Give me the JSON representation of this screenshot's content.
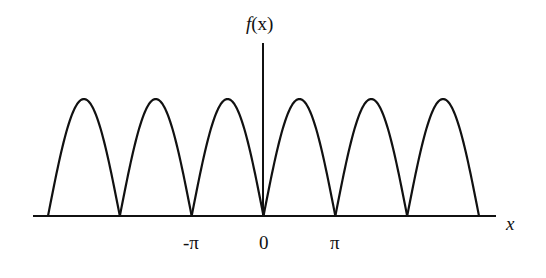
{
  "chart_data": {
    "type": "line",
    "title": "",
    "function": "f(x) = |sin(x)| (full-wave rectified sine)",
    "xlabel": "x",
    "ylabel": "f(x)",
    "x_ticks": [
      {
        "label": "-π",
        "value": -3.14159
      },
      {
        "label": "0",
        "value": 0
      },
      {
        "label": "π",
        "value": 3.14159
      }
    ],
    "period": "π",
    "zero_crossings": [
      "-3π",
      "-2π",
      "-π",
      "0",
      "π",
      "2π",
      "3π"
    ],
    "num_arches": 6,
    "x_range": [
      -3.14159,
      3.14159
    ],
    "x_plot_range": [
      "-3π",
      "3π"
    ],
    "y_range": [
      0,
      1
    ],
    "grid": false,
    "legend": null,
    "line_color": "#111111"
  },
  "labels": {
    "y_axis": "f(x)",
    "y_axis_f": "f",
    "y_axis_arg": "(x)",
    "x_axis": "x",
    "tick_neg_pi": "-π",
    "tick_zero": "0",
    "tick_pi": "π"
  }
}
